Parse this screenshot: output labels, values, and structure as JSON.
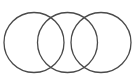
{
  "diagram": {
    "type": "three-overlapping-circles",
    "stroke_color": "#4a4a4a",
    "background": "#ffffff",
    "circles": [
      {
        "id": "left",
        "cx": 34,
        "cy": 42.5,
        "r": 30
      },
      {
        "id": "middle",
        "cx": 67.5,
        "cy": 42.5,
        "r": 30
      },
      {
        "id": "right",
        "cx": 101,
        "cy": 42.5,
        "r": 30
      }
    ]
  }
}
